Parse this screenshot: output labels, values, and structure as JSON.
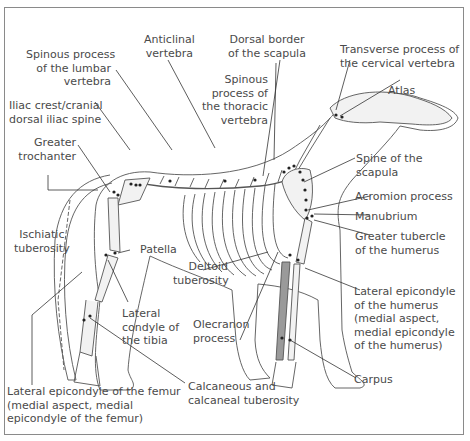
{
  "figure": {
    "colors": {
      "line": "#444444",
      "bone_fill": "#f2f2f2",
      "shaded_bone": "#9a9a9a",
      "marker": "#222222",
      "border": "#8a8a8a"
    }
  },
  "labels": {
    "spinous_lumbar": [
      "Spinous process",
      "of the lumbar",
      "vertebra"
    ],
    "anticlinal": [
      "Anticlinal",
      "vertebra"
    ],
    "dorsal_border_scapula": [
      "Dorsal border",
      "of the scapula"
    ],
    "transverse_cervical": [
      "Transverse process of",
      "the cervical vertebra"
    ],
    "atlas": [
      "Atlas"
    ],
    "spinous_thoracic": [
      "Spinous",
      "process of",
      "the thoracic",
      "vertebra"
    ],
    "iliac_crest": [
      "Iliac crest/cranial",
      "dorsal iliac spine"
    ],
    "greater_trochanter": [
      "Greater",
      "trochanter"
    ],
    "spine_scapula": [
      "Spine of the",
      "scapula"
    ],
    "acromion": [
      "Acromion process"
    ],
    "manubrium": [
      "Manubrium"
    ],
    "greater_tubercle": [
      "Greater tubercle",
      "of the humerus"
    ],
    "ischiatic": [
      "Ischiatic",
      "tuberosity"
    ],
    "patella": [
      "Patella"
    ],
    "deltoid": [
      "Deltoid",
      "tuberosity"
    ],
    "lateral_epicondyle_humerus": [
      "Lateral epicondyle",
      "of the humerus",
      "(medial aspect,",
      "medial epicondyle",
      "of the humerus)"
    ],
    "lateral_condyle_tibia": [
      "Lateral",
      "condyle of",
      "the tibia"
    ],
    "olecranon": [
      "Olecranon",
      "process"
    ],
    "carpus": [
      "Carpus"
    ],
    "calcaneous": [
      "Calcaneous and",
      "calcaneal tuberosity"
    ],
    "lateral_epicondyle_femur": [
      "Lateral epicondyle of the femur",
      "(medial aspect, medial",
      "epicondyle of the femur)"
    ]
  }
}
